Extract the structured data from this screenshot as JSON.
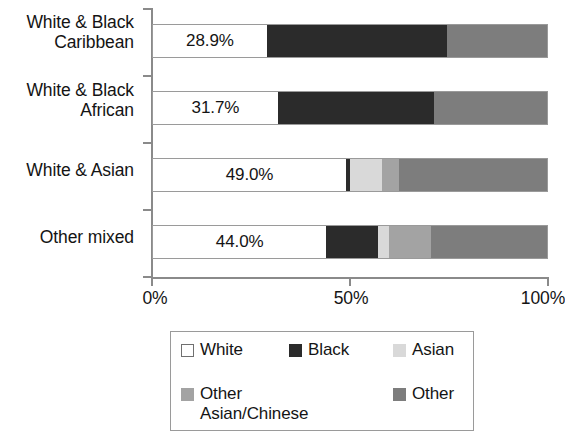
{
  "chart_data": {
    "type": "bar",
    "orientation": "horizontal",
    "stacked": true,
    "stack_total": 100,
    "title": "",
    "subtitle": "",
    "xlabel": "",
    "ylabel": "",
    "xlim": [
      0,
      100
    ],
    "xticks": [
      0,
      50,
      100
    ],
    "xtick_labels": [
      "0%",
      "50%",
      "100%"
    ],
    "grid": false,
    "legend_position": "bottom",
    "categories": [
      "White & Black Caribbean",
      "White & Black African",
      "White & Asian",
      "Other mixed"
    ],
    "category_label_lines": [
      [
        "White & Black",
        "Caribbean"
      ],
      [
        "White & Black",
        "African"
      ],
      [
        "White & Asian"
      ],
      [
        "Other mixed"
      ]
    ],
    "series": [
      {
        "name": "White",
        "color": "#ffffff",
        "values": [
          28.9,
          31.7,
          49.0,
          44.0
        ]
      },
      {
        "name": "Black",
        "color": "#2b2b2b",
        "values": [
          45.6,
          39.5,
          1.0,
          13.0
        ]
      },
      {
        "name": "Asian",
        "color": "#d9d9d9",
        "values": [
          0.0,
          0.0,
          8.0,
          3.0
        ]
      },
      {
        "name": "Other Asian/Chinese",
        "color": "#a3a3a3",
        "values": [
          0.0,
          0.0,
          4.5,
          10.5
        ]
      },
      {
        "name": "Other",
        "color": "#7d7d7d",
        "values": [
          25.5,
          28.8,
          37.5,
          29.5
        ]
      }
    ],
    "data_labels": [
      "28.9%",
      "31.7%",
      "49.0%",
      "44.0%"
    ],
    "data_label_series": "White",
    "legend_entries": [
      {
        "label": "White",
        "color": "#ffffff",
        "bordered": true
      },
      {
        "label": "Black",
        "color": "#2b2b2b",
        "bordered": false
      },
      {
        "label": "Asian",
        "color": "#d9d9d9",
        "bordered": false
      },
      {
        "label": "Other Asian/Chinese",
        "color": "#a3a3a3",
        "bordered": false
      },
      {
        "label": "Other",
        "color": "#7d7d7d",
        "bordered": false
      }
    ]
  },
  "legend": {
    "row1": [
      {
        "label": "White"
      },
      {
        "label": "Black"
      },
      {
        "label": "Asian"
      }
    ],
    "row2": [
      {
        "label": "Other Asian/Chinese"
      },
      {
        "label": "Other"
      }
    ],
    "other_asian_line1": "Other",
    "other_asian_line2": "Asian/Chinese"
  },
  "axis": {
    "x_labels": [
      "0%",
      "50%",
      "100%"
    ]
  }
}
